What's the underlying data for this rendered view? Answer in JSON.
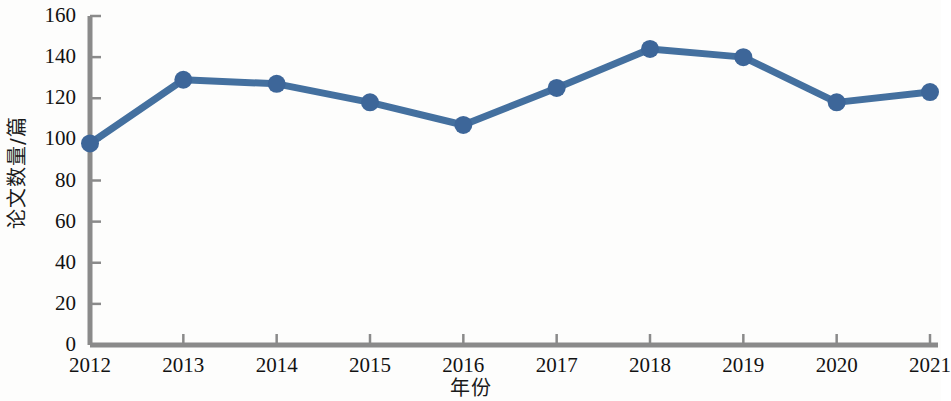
{
  "chart_data": {
    "type": "line",
    "title": "",
    "xlabel": "年份",
    "ylabel": "论文数量/篇",
    "categories": [
      "2012",
      "2013",
      "2014",
      "2015",
      "2016",
      "2017",
      "2018",
      "2019",
      "2020",
      "2021"
    ],
    "values": [
      98,
      129,
      127,
      118,
      107,
      125,
      144,
      140,
      118,
      123
    ],
    "series": [
      {
        "name": "论文数量",
        "values": [
          98,
          129,
          127,
          118,
          107,
          125,
          144,
          140,
          118,
          123
        ],
        "color": "#44709f",
        "marker": "circle",
        "marker_color": "#3d6699"
      }
    ],
    "ylim": [
      0,
      160
    ],
    "ytick_labels": [
      "160",
      "140",
      "120",
      "100",
      "80",
      "60",
      "40",
      "20",
      "0"
    ],
    "ytick_values": [
      160,
      140,
      120,
      100,
      80,
      60,
      40,
      20,
      0
    ],
    "xtick_labels": [
      "2012",
      "2013",
      "2014",
      "2015",
      "2016",
      "2017",
      "2018",
      "2019",
      "2020",
      "2021"
    ],
    "grid": false,
    "legend": false,
    "legend_position": "none",
    "axis_color": "#8a8a8a",
    "text_color": "#121212",
    "background": "#fdfdfc"
  },
  "axes": {
    "y_title": "论文数量/篇",
    "x_title": "年份"
  }
}
